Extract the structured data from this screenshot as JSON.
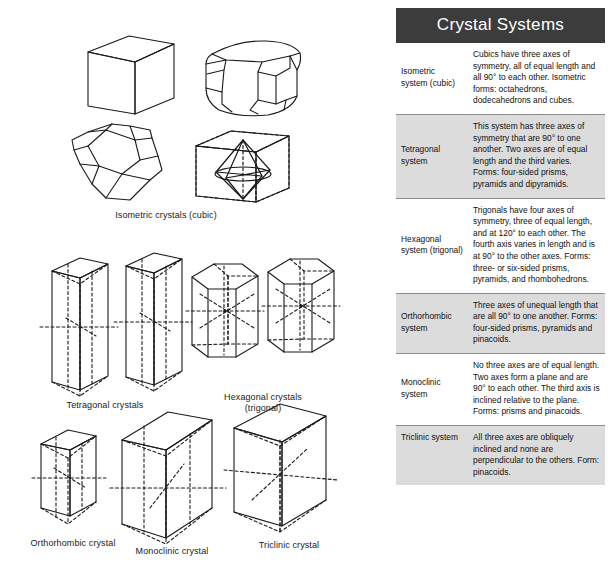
{
  "figures": {
    "groups": [
      {
        "label": "Isometric crystals (cubic)"
      },
      {
        "label": "Tetragonal crystals"
      },
      {
        "label": "Hexagonal crystals\n(trigonal)"
      },
      {
        "label": "Orthorhombic crystal"
      },
      {
        "label": "Monoclinic crystal"
      },
      {
        "label": "Triclinic crystal"
      }
    ]
  },
  "table": {
    "title": "Crystal Systems",
    "header_bg": "#3c3c3c",
    "header_fg": "#ffffff",
    "shaded_row_bg": "#dcdcdc",
    "plain_row_bg": "#ffffff",
    "rows": [
      {
        "name": "Isometric\nsystem (cubic)",
        "description": "Cubics have three axes of symmetry, all of equal length and all 90° to each other. Isometric forms: octahedrons, dodecahedrons and cubes."
      },
      {
        "name": "Tetragonal\nsystem",
        "description": "This system has three axes of symmetry that are 90° to one another. Two axes are of equal length and the third varies. Forms: four-sided prisms, pyramids and dipyramids."
      },
      {
        "name": "Hexagonal\nsystem (trigonal)",
        "description": "Trigonals have four axes of symmetry, three of equal length, and at 120° to each other. The fourth axis varies in length and is at 90° to the other axes. Forms: three- or six-sided prisms, pyramids, and rhombohedrons."
      },
      {
        "name": "Orthorhombic\nsystem",
        "description": "Three axes of unequal length that are all 90° to one another. Forms: four-sided prisms, pyramids and pinacoids."
      },
      {
        "name": "Monoclinic\nsystem",
        "description": "No three axes are of equal length. Two axes form a plane and are 90° to each other. The third axis is inclined relative  to the plane. Forms: prisms and pinacoids."
      },
      {
        "name": "Triclinic system",
        "description": "All three axes are obliquely inclined and none are perpendicular to the others. Form: pinacoids."
      }
    ]
  }
}
